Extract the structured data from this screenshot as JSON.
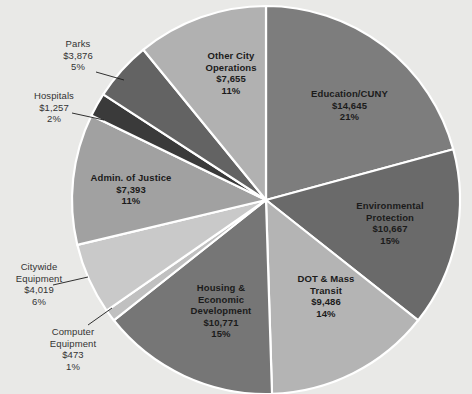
{
  "chart_data": {
    "type": "pie",
    "title": "",
    "subtitle": "",
    "legend_position": "none",
    "grid": false,
    "value_prefix": "$",
    "start_angle_deg": 0,
    "direction": "clockwise",
    "categories": [
      "Education/CUNY",
      "Environmental Protection",
      "DOT & Mass Transit",
      "Housing & Economic Development",
      "Computer Equipment",
      "Citywide Equipment",
      "Admin. of Justice",
      "Hospitals",
      "Parks",
      "Other City Operations"
    ],
    "values": [
      14645,
      10667,
      9486,
      10771,
      473,
      4019,
      7393,
      1257,
      3876,
      7655
    ],
    "percents": [
      21,
      15,
      14,
      15,
      1,
      6,
      11,
      2,
      5,
      11
    ],
    "colors": [
      "#7d7d7d",
      "#6a6a6a",
      "#b4b4b4",
      "#767676",
      "#c0c0c0",
      "#c9c9c9",
      "#a1a1a1",
      "#3a3a3a",
      "#636363",
      "#b1b1b1"
    ],
    "slices": [
      {
        "name": "Education/CUNY",
        "label_lines": "Education/CUNY\n$14,645\n21%",
        "value_text": "$14,645",
        "percent_text": "21%",
        "value": 14645,
        "percent": 21,
        "color": "#7d7d7d",
        "label_placement": "inside"
      },
      {
        "name": "Environmental Protection",
        "label_lines": "Environmental\nProtection\n$10,667\n15%",
        "value_text": "$10,667",
        "percent_text": "15%",
        "value": 10667,
        "percent": 15,
        "color": "#6a6a6a",
        "label_placement": "inside"
      },
      {
        "name": "DOT & Mass Transit",
        "label_lines": "DOT & Mass\nTransit\n$9,486\n14%",
        "value_text": "$9,486",
        "percent_text": "14%",
        "value": 9486,
        "percent": 14,
        "color": "#b4b4b4",
        "label_placement": "inside"
      },
      {
        "name": "Housing & Economic Development",
        "label_lines": "Housing &\nEconomic\nDevelopment\n$10,771\n15%",
        "value_text": "$10,771",
        "percent_text": "15%",
        "value": 10771,
        "percent": 15,
        "color": "#767676",
        "label_placement": "inside"
      },
      {
        "name": "Computer Equipment",
        "label_lines": "Computer\nEquipment\n$473\n1%",
        "value_text": "$473",
        "percent_text": "1%",
        "value": 473,
        "percent": 1,
        "color": "#c0c0c0",
        "label_placement": "outside"
      },
      {
        "name": "Citywide Equipment",
        "label_lines": "Citywide\nEquipment\n$4,019\n6%",
        "value_text": "$4,019",
        "percent_text": "6%",
        "value": 4019,
        "percent": 6,
        "color": "#c9c9c9",
        "label_placement": "outside"
      },
      {
        "name": "Admin. of Justice",
        "label_lines": "Admin. of Justice\n$7,393\n11%",
        "value_text": "$7,393",
        "percent_text": "11%",
        "value": 7393,
        "percent": 11,
        "color": "#a1a1a1",
        "label_placement": "inside"
      },
      {
        "name": "Hospitals",
        "label_lines": "Hospitals\n$1,257\n2%",
        "value_text": "$1,257",
        "percent_text": "2%",
        "value": 1257,
        "percent": 2,
        "color": "#3a3a3a",
        "label_placement": "outside"
      },
      {
        "name": "Parks",
        "label_lines": "Parks\n$3,876\n5%",
        "value_text": "$3,876",
        "percent_text": "5%",
        "value": 3876,
        "percent": 5,
        "color": "#636363",
        "label_placement": "outside"
      },
      {
        "name": "Other City Operations",
        "label_lines": "Other City\nOperations\n$7,655\n11%",
        "value_text": "$7,655",
        "percent_text": "11%",
        "value": 7655,
        "percent": 11,
        "color": "#b1b1b1",
        "label_placement": "inside"
      }
    ],
    "background_color": "#e9e9e7",
    "separator_color": "#ffffff"
  }
}
